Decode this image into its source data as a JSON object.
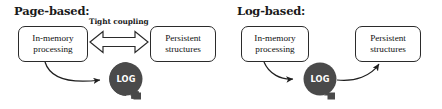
{
  "figure": {
    "kind": "two-panel-architecture-diagram",
    "background_color": "#ffffff",
    "stroke_color": "#2b2b2b",
    "log_fill_color": "#4a4a4a",
    "log_text_color": "#ffffff"
  },
  "panels": [
    {
      "id": "page-based",
      "title": "Page-based:",
      "nodes": [
        {
          "id": "in-memory",
          "label": "In-memory\nprocessing"
        },
        {
          "id": "persistent",
          "label": "Persistent\nstructures"
        },
        {
          "id": "log",
          "label": "LOG"
        }
      ],
      "edges": [
        {
          "id": "tight-coupling",
          "label": "Tight coupling",
          "style": "hollow-double-headed-block-arrow",
          "from": "in-memory",
          "to": "persistent"
        },
        {
          "id": "in-memory-to-log",
          "label": "",
          "style": "curved-arrow",
          "from": "in-memory",
          "to": "log"
        }
      ]
    },
    {
      "id": "log-based",
      "title": "Log-based:",
      "nodes": [
        {
          "id": "in-memory",
          "label": "In-memory\nprocessing"
        },
        {
          "id": "persistent",
          "label": "Persistent\nstructures"
        },
        {
          "id": "log",
          "label": "LOG"
        }
      ],
      "edges": [
        {
          "id": "in-memory-to-log",
          "label": "",
          "style": "curved-arrow",
          "from": "in-memory",
          "to": "log"
        },
        {
          "id": "log-to-persistent",
          "label": "",
          "style": "curved-arrow",
          "from": "log",
          "to": "persistent"
        }
      ]
    }
  ]
}
